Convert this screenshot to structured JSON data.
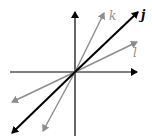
{
  "diagram": {
    "colors": {
      "axes": "#000000",
      "j": "#000000",
      "k": "#8c8c8c",
      "l": "#8c8c8c"
    },
    "axes": {
      "horizontal": {
        "x1": 10,
        "y1": 72,
        "x2": 137,
        "y2": 72
      },
      "vertical": {
        "x1": 75,
        "y1": 136,
        "x2": 75,
        "y2": 12
      }
    },
    "lines": [
      {
        "name": "j",
        "label": "j",
        "x1": 12,
        "y1": 133,
        "x2": 138,
        "y2": 12,
        "label_x": 141,
        "label_y": 19,
        "bold": true
      },
      {
        "name": "k",
        "label": "k",
        "x1": 43,
        "y1": 131,
        "x2": 104,
        "y2": 13,
        "label_x": 109,
        "label_y": 20,
        "bold": false
      },
      {
        "name": "l",
        "label": "l",
        "x1": 12,
        "y1": 102,
        "x2": 137,
        "y2": 42,
        "label_x": 133,
        "label_y": 57,
        "bold": false
      }
    ]
  }
}
